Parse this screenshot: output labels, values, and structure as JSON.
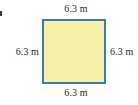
{
  "figure": {
    "type": "square-geometry-diagram",
    "shape_name": "square",
    "marker": "",
    "colors": {
      "background": "#ffffff",
      "shape_fill": "#f7f0a8",
      "shape_stroke": "#3b7cb5",
      "label_text": "#231f20"
    },
    "labels": {
      "top": "6.3 m",
      "right": "6.3 m",
      "bottom": "6.3 m",
      "left": "6.3 m"
    },
    "measurements": {
      "side_length_value": "6.3",
      "unit": "m"
    }
  }
}
